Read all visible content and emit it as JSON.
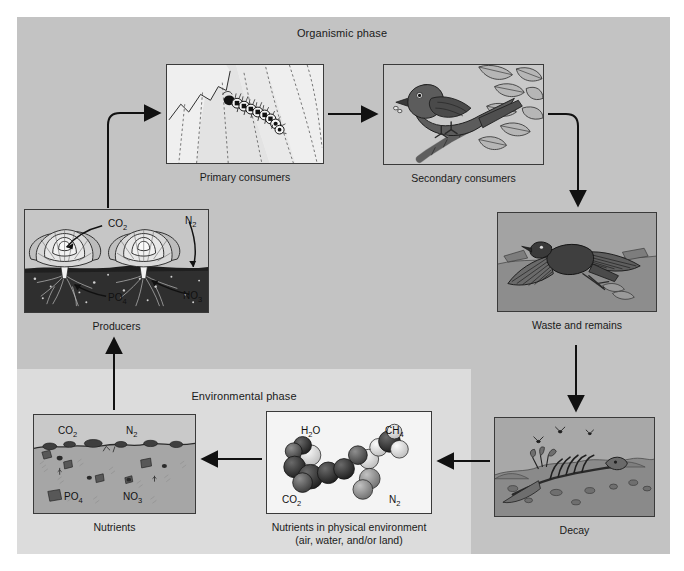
{
  "figure": {
    "background": "#ffffff"
  },
  "phases": {
    "organismic": {
      "label": "Organismic phase",
      "color": "#c3c3c3"
    },
    "environmental": {
      "label": "Environmental phase",
      "color": "#dcdcdc"
    }
  },
  "panels": {
    "primary_consumers": {
      "caption": "Primary consumers",
      "depicts": "caterpillar-on-leaf",
      "background": "#ededed"
    },
    "secondary_consumers": {
      "caption": "Secondary consumers",
      "depicts": "bird-on-branch-with-insect",
      "background": "#c9c9c9"
    },
    "waste_and_remains": {
      "caption": "Waste and remains",
      "depicts": "dead-bird-with-spread-wings",
      "background": "#9a9a9a"
    },
    "producers": {
      "caption": "Producers",
      "depicts": "cabbage-plants-with-roots-in-soil",
      "background": "#bdbdbd",
      "labels": {
        "co2": "CO",
        "co2_sub": "2",
        "n2": "N",
        "n2_sub": "2",
        "po4": "PO",
        "po4_sub": "4",
        "no3": "NO",
        "no3_sub": "3"
      }
    },
    "decay": {
      "caption": "Decay",
      "depicts": "decomposing-skeleton-with-flies",
      "background": "#9c9c9c"
    },
    "nutrients": {
      "caption": "Nutrients",
      "depicts": "soil-cross-section-with-rocks",
      "background": "#b4b4b4",
      "labels": {
        "co2": "CO",
        "co2_sub": "2",
        "n2": "N",
        "n2_sub": "2",
        "po4": "PO",
        "po4_sub": "4",
        "no3": "NO",
        "no3_sub": "3"
      }
    },
    "molecules": {
      "caption": "Nutrients in physical environment\n(air, water, and/or land)",
      "depicts": "space-filling-molecular-models",
      "background": "#f2f2f2",
      "labels": {
        "h2o": "H",
        "h2o_sub": "2",
        "h2o_rest": "O",
        "ch4": "CH",
        "ch4_sub": "4",
        "co2": "CO",
        "co2_sub": "2",
        "n2": "N",
        "n2_sub": "2"
      }
    }
  },
  "arrows": [
    {
      "name": "producers-to-primary-consumers",
      "from": "producers",
      "to": "primary_consumers",
      "style": "elbow-up-right"
    },
    {
      "name": "primary-to-secondary-consumers",
      "from": "primary_consumers",
      "to": "secondary_consumers",
      "style": "straight-right"
    },
    {
      "name": "secondary-consumers-to-waste",
      "from": "secondary_consumers",
      "to": "waste_and_remains",
      "style": "elbow-right-down"
    },
    {
      "name": "waste-to-decay",
      "from": "waste_and_remains",
      "to": "decay",
      "style": "straight-down"
    },
    {
      "name": "decay-to-molecules",
      "from": "decay",
      "to": "molecules",
      "style": "straight-left"
    },
    {
      "name": "molecules-to-nutrients",
      "from": "molecules",
      "to": "nutrients",
      "style": "straight-left"
    },
    {
      "name": "nutrients-to-producers",
      "from": "nutrients",
      "to": "producers",
      "style": "straight-up"
    }
  ],
  "colors": {
    "arrow": "#111111",
    "panel_border": "#3a3a3a",
    "text": "#1a1a1a"
  }
}
